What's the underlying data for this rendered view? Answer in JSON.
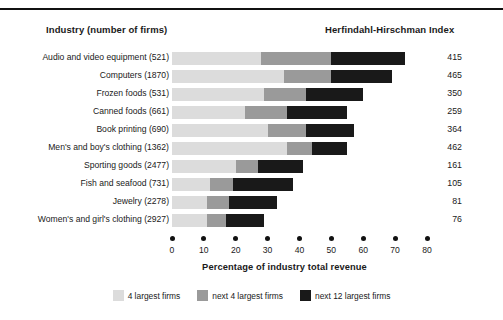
{
  "header": {
    "industry_column": "Industry (number of firms)",
    "hhi_column": "Herfindahl-Hirschman Index"
  },
  "axis": {
    "title": "Percentage of industry total revenue",
    "ticks": [
      "0",
      "10",
      "20",
      "30",
      "40",
      "50",
      "60",
      "70",
      "80"
    ]
  },
  "legend": [
    {
      "label": "4 largest firms",
      "color": "#dcdcdc"
    },
    {
      "label": "next 4 largest firms",
      "color": "#9a9a9a"
    },
    {
      "label": "next 12 largest firms",
      "color": "#191919"
    }
  ],
  "colors": {
    "seg_4_largest": "#dcdcdc",
    "seg_next_4": "#9a9a9a",
    "seg_next_12": "#191919",
    "rule": "#111111"
  },
  "rows": [
    {
      "label": "Audio and video equipment  (521)",
      "industry": "Audio and video equipment",
      "firms": 521,
      "hhi": "415"
    },
    {
      "label": "Computers  (1870)",
      "industry": "Computers",
      "firms": 1870,
      "hhi": "465"
    },
    {
      "label": "Frozen foods  (531)",
      "industry": "Frozen foods",
      "firms": 531,
      "hhi": "350"
    },
    {
      "label": "Canned foods  (661)",
      "industry": "Canned foods",
      "firms": 661,
      "hhi": "259"
    },
    {
      "label": "Book printing  (690)",
      "industry": "Book printing",
      "firms": 690,
      "hhi": "364"
    },
    {
      "label": "Men's and boy's clothing  (1362)",
      "industry": "Men's and boy's clothing",
      "firms": 1362,
      "hhi": "462"
    },
    {
      "label": "Sporting goods  (2477)",
      "industry": "Sporting goods",
      "firms": 2477,
      "hhi": "161"
    },
    {
      "label": "Fish and seafood  (731)",
      "industry": "Fish and seafood",
      "firms": 731,
      "hhi": "105"
    },
    {
      "label": "Jewelry  (2278)",
      "industry": "Jewelry",
      "firms": 2278,
      "hhi": "81"
    },
    {
      "label": "Women's and girl's clothing  (2927)",
      "industry": "Women's and girl's clothing",
      "firms": 2927,
      "hhi": "76"
    }
  ],
  "chart_data": {
    "type": "bar",
    "orientation": "horizontal",
    "stacked": true,
    "title": "",
    "xlabel": "Percentage of industry total revenue",
    "ylabel": "Industry (number of firms)",
    "xlim": [
      0,
      80
    ],
    "xticks": [
      0,
      10,
      20,
      30,
      40,
      50,
      60,
      70,
      80
    ],
    "grid": false,
    "legend_position": "bottom",
    "categories": [
      "Audio and video equipment (521)",
      "Computers (1870)",
      "Frozen foods (531)",
      "Canned foods (661)",
      "Book printing (690)",
      "Men's and boy's clothing (1362)",
      "Sporting goods (2477)",
      "Fish and seafood (731)",
      "Jewelry (2278)",
      "Women's and girl's clothing (2927)"
    ],
    "series": [
      {
        "name": "4 largest firms",
        "color": "#dcdcdc",
        "values": [
          28,
          35,
          29,
          23,
          30,
          36,
          20,
          12,
          11,
          11
        ]
      },
      {
        "name": "next 4 largest firms",
        "color": "#9a9a9a",
        "values": [
          22,
          15,
          13,
          13,
          12,
          8,
          7,
          7,
          7,
          6
        ]
      },
      {
        "name": "next 12 largest firms",
        "color": "#191919",
        "values": [
          23,
          19,
          18,
          19,
          15,
          11,
          14,
          19,
          15,
          12
        ]
      }
    ],
    "annotations": {
      "Herfindahl-Hirschman Index": [
        415,
        465,
        350,
        259,
        364,
        462,
        161,
        105,
        81,
        76
      ]
    }
  }
}
